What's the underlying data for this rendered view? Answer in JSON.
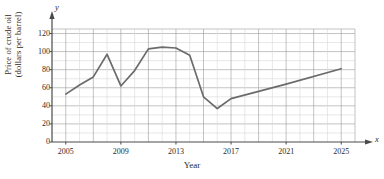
{
  "chart_data": {
    "type": "line",
    "title": "",
    "xlabel": "Year",
    "ylabel_line1": "Price of crude oil",
    "ylabel_line2": "(dollars per barrel)",
    "x_axis_letter": "x",
    "y_axis_letter": "y",
    "xlim": [
      2004,
      2026
    ],
    "ylim": [
      0,
      125
    ],
    "xticks": [
      2005,
      2009,
      2013,
      2017,
      2021,
      2025
    ],
    "xtick_labels": [
      "2005",
      "2009",
      "2013",
      "2017",
      "2021",
      "2025"
    ],
    "yticks": [
      0,
      20,
      40,
      60,
      80,
      100,
      120
    ],
    "ytick_labels": [
      "0",
      "20",
      "40",
      "60",
      "80",
      "100",
      "120"
    ],
    "grid": true,
    "grid_major_color": "#9a9a9a",
    "grid_minor_color": "#d8d8d8",
    "line_color": "#6b6b6b",
    "axis_color": "#4a4a4a",
    "legend": null,
    "x": [
      2005,
      2006,
      2007,
      2008,
      2009,
      2010,
      2011,
      2012,
      2013,
      2014,
      2015,
      2016,
      2017,
      2021,
      2025
    ],
    "values": [
      53,
      63,
      72,
      97,
      62,
      79,
      103,
      105,
      104,
      96,
      50,
      37,
      48,
      64,
      81
    ],
    "series": [
      {
        "name": "Price of crude oil",
        "values": [
          53,
          63,
          72,
          97,
          62,
          79,
          103,
          105,
          104,
          96,
          50,
          37,
          48,
          64,
          81
        ]
      }
    ]
  }
}
